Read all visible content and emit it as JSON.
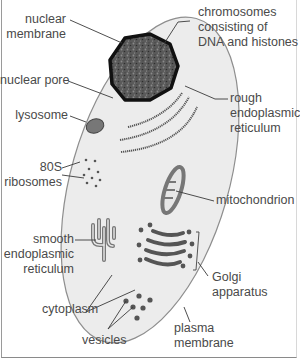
{
  "diagram": {
    "colors": {
      "cytoplasm": "#ececec",
      "membrane": "#8e8e8e",
      "nucleus_fill": "#555555",
      "nucleus_border": "#111111",
      "organelle": "#777777",
      "organelle_dark": "#5a5a5a",
      "leader_line": "#3a3a3a",
      "text": "#4a4a4a"
    },
    "labels": {
      "nuclear_membrane": [
        "nuclear",
        "membrane"
      ],
      "chromosomes": [
        "chromosomes",
        "consisting of",
        "DNA and histones"
      ],
      "nuclear_pore": [
        "nuclear pore"
      ],
      "rough_er": [
        "rough",
        "endoplasmic",
        "reticulum"
      ],
      "lysosome": [
        "lysosome"
      ],
      "ribosomes": [
        "80S",
        "ribosomes"
      ],
      "mitochondrion": [
        "mitochondrion"
      ],
      "smooth_er": [
        "smooth",
        "endoplasmic",
        "reticulum"
      ],
      "golgi": [
        "Golgi",
        "apparatus"
      ],
      "cytoplasm": [
        "cytoplasm"
      ],
      "plasma_membrane": [
        "plasma",
        "membrane"
      ],
      "vesicles": [
        "vesicles"
      ]
    }
  }
}
